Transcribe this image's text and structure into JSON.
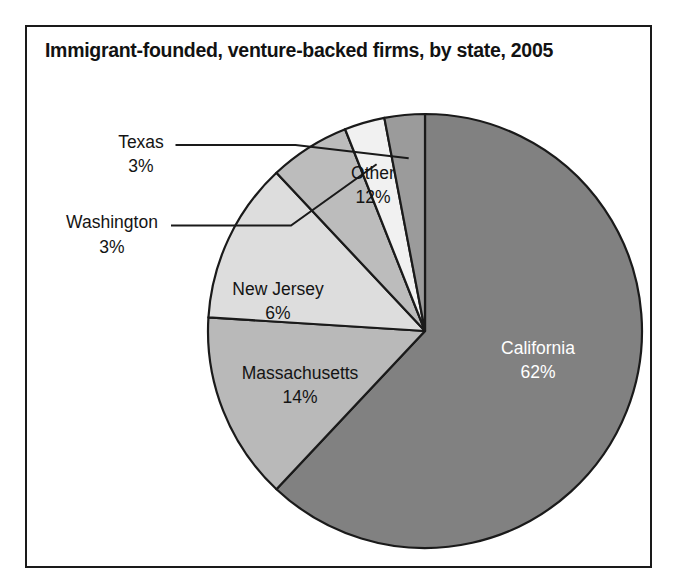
{
  "frame": {
    "border_color": "#1a1a1a"
  },
  "chart_data": {
    "type": "pie",
    "title": "Immigrant-founded, venture-backed firms, by state, 2005",
    "subtitle": "",
    "xlabel": "",
    "ylabel": "",
    "legend_position": "none",
    "grid": false,
    "units": "percent",
    "categories": [
      "California",
      "Massachusetts",
      "Other",
      "New Jersey",
      "Washington",
      "Texas"
    ],
    "values": [
      62,
      14,
      12,
      6,
      3,
      3
    ],
    "value_labels": [
      "62%",
      "14%",
      "12%",
      "6%",
      "3%",
      "3%"
    ],
    "colors": [
      "#818181",
      "#b9b9b9",
      "#dddddd",
      "#bcbcbc",
      "#f1f1f1",
      "#9b9b9b"
    ],
    "start_angle_deg": 0,
    "direction": "clockwise",
    "slices": [
      {
        "name": "California",
        "value": 62,
        "value_label": "62%",
        "color": "#818181",
        "label_placement": "inside",
        "label_color": "#ffffff",
        "label_x": 538,
        "label_y": 349,
        "label_y2": 373
      },
      {
        "name": "Massachusetts",
        "value": 14,
        "value_label": "14%",
        "color": "#b9b9b9",
        "label_placement": "inside",
        "label_color": "#141414",
        "label_x": 300,
        "label_y": 374,
        "label_y2": 398
      },
      {
        "name": "Other",
        "value": 12,
        "value_label": "12%",
        "color": "#dddddd",
        "label_placement": "inside",
        "label_color": "#141414",
        "label_x": 373,
        "label_y": 174,
        "label_y2": 198
      },
      {
        "name": "New Jersey",
        "value": 6,
        "value_label": "6%",
        "color": "#bcbcbc",
        "label_placement": "inside",
        "label_color": "#141414",
        "label_x": 278,
        "label_y": 290,
        "label_y2": 314
      },
      {
        "name": "Washington",
        "value": 3,
        "value_label": "3%",
        "color": "#f1f1f1",
        "label_placement": "callout",
        "label_color": "#141414",
        "label_x": 112,
        "label_y": 223,
        "label_y2": 248
      },
      {
        "name": "Texas",
        "value": 3,
        "value_label": "3%",
        "color": "#9b9b9b",
        "label_placement": "callout",
        "label_color": "#141414",
        "label_x": 141,
        "label_y": 143,
        "label_y2": 167
      }
    ],
    "geometry": {
      "cx": 425,
      "cy": 331,
      "r": 217
    }
  }
}
